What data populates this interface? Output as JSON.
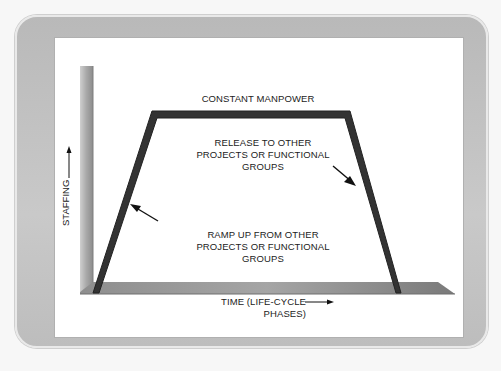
{
  "diagram": {
    "top_label": "CONSTANT MANPOWER",
    "release_label": [
      "RELEASE TO OTHER",
      "PROJECTS OR FUNCTIONAL",
      "GROUPS"
    ],
    "rampup_label": [
      "RAMP UP FROM OTHER",
      "PROJECTS OR FUNCTIONAL",
      "GROUPS"
    ],
    "x_axis_label": "TIME (LIFE-CYCLE PHASES)",
    "y_axis_label": "STAFFING",
    "colors": {
      "frame": "#c2c2c2",
      "panel": "#ffffff",
      "trapezoid": "#333333",
      "axis": "#9a9a9a"
    }
  }
}
